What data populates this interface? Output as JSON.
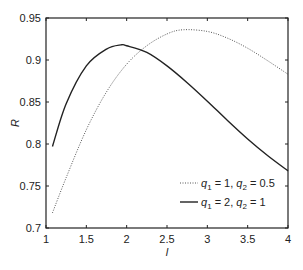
{
  "chart_data": {
    "type": "line",
    "title": "",
    "xlabel": "l",
    "ylabel": "R",
    "xlim": [
      1,
      4
    ],
    "ylim": [
      0.7,
      0.95
    ],
    "xticks": [
      1,
      1.5,
      2,
      2.5,
      3,
      3.5,
      4
    ],
    "xtick_labels": [
      "1",
      "1.5",
      "2",
      "2.5",
      "3",
      "3.5",
      "4"
    ],
    "yticks": [
      0.7,
      0.75,
      0.8,
      0.85,
      0.9,
      0.95
    ],
    "ytick_labels": [
      "0.7",
      "0.75",
      "0.8",
      "0.85",
      "0.9",
      "0.95"
    ],
    "grid": false,
    "legend_position": "lower right",
    "series": [
      {
        "name": "q1 = 1, q2 = 0.5",
        "style": "dotted",
        "color": "#555555",
        "x": [
          1.08,
          1.25,
          1.5,
          1.75,
          2.0,
          2.25,
          2.5,
          2.7,
          3.0,
          3.25,
          3.5,
          3.75,
          4.0
        ],
        "y": [
          0.718,
          0.76,
          0.817,
          0.862,
          0.895,
          0.917,
          0.931,
          0.936,
          0.934,
          0.926,
          0.914,
          0.899,
          0.883
        ]
      },
      {
        "name": "q1 = 2, q2 = 1",
        "style": "solid",
        "color": "#222222",
        "x": [
          1.08,
          1.25,
          1.5,
          1.75,
          1.93,
          2.0,
          2.25,
          2.5,
          2.75,
          3.0,
          3.25,
          3.5,
          3.75,
          4.0
        ],
        "y": [
          0.797,
          0.848,
          0.893,
          0.913,
          0.918,
          0.917,
          0.909,
          0.893,
          0.873,
          0.851,
          0.828,
          0.806,
          0.786,
          0.768
        ]
      }
    ]
  },
  "legend": {
    "entries": [
      {
        "q1_label": "q",
        "q1_sub": "1",
        "q1_val": " = 1, ",
        "q2_label": "q",
        "q2_sub": "2",
        "q2_val": " = 0.5"
      },
      {
        "q1_label": "q",
        "q1_sub": "1",
        "q1_val": " = 2, ",
        "q2_label": "q",
        "q2_sub": "2",
        "q2_val": " = 1"
      }
    ]
  }
}
